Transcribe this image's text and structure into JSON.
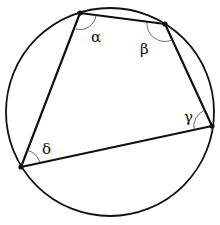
{
  "diagram": {
    "type": "cyclic-quadrilateral",
    "circle": {
      "cx": 110,
      "cy": 112,
      "r": 104
    },
    "vertices": [
      {
        "id": "A",
        "x": 80,
        "y": 13
      },
      {
        "id": "B",
        "x": 165,
        "y": 24
      },
      {
        "id": "C",
        "x": 212,
        "y": 126
      },
      {
        "id": "D",
        "x": 21,
        "y": 167
      }
    ],
    "angle_labels": {
      "alpha": "α",
      "beta": "β",
      "gamma": "γ",
      "delta": "δ"
    },
    "colors": {
      "stroke": "#111111",
      "background": "#ffffff"
    }
  }
}
